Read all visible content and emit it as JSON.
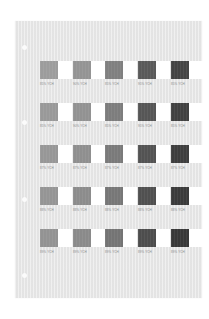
{
  "sheet": {
    "background": "#e8e8e8",
    "holes": [
      {
        "top": 24
      },
      {
        "top": 99
      },
      {
        "top": 176
      },
      {
        "top": 252
      }
    ]
  },
  "rows": [
    {
      "top": 40,
      "cells": [
        {
          "color": "#9c9c9c",
          "label": "85% YCH"
        },
        {
          "color": "#949494",
          "label": "90% YCH"
        },
        {
          "color": "#808080",
          "label": "85% YCH"
        },
        {
          "color": "#5a5a5a",
          "label": "95% YCH"
        },
        {
          "color": "#444444",
          "label": "85% YCH"
        }
      ]
    },
    {
      "top": 82,
      "cells": [
        {
          "color": "#999999",
          "label": "85% YCH"
        },
        {
          "color": "#929292",
          "label": "90% YCH"
        },
        {
          "color": "#7d7d7d",
          "label": "85% YCH"
        },
        {
          "color": "#565656",
          "label": "95% YCH"
        },
        {
          "color": "#414141",
          "label": "85% YCH"
        }
      ]
    },
    {
      "top": 124,
      "cells": [
        {
          "color": "#979797",
          "label": "87% YCH"
        },
        {
          "color": "#8f8f8f",
          "label": "87% YCH"
        },
        {
          "color": "#7a7a7a",
          "label": "87% YCH"
        },
        {
          "color": "#535353",
          "label": "87% YCH"
        },
        {
          "color": "#3e3e3e",
          "label": "87% YCH"
        }
      ]
    },
    {
      "top": 166,
      "cells": [
        {
          "color": "#959595",
          "label": "88% YCH"
        },
        {
          "color": "#8c8c8c",
          "label": "88% YCH"
        },
        {
          "color": "#777777",
          "label": "88% YCH"
        },
        {
          "color": "#505050",
          "label": "88% YCH"
        },
        {
          "color": "#3b3b3b",
          "label": "88% YCH"
        }
      ]
    },
    {
      "top": 208,
      "cells": [
        {
          "color": "#939393",
          "label": "89% YCH"
        },
        {
          "color": "#8a8a8a",
          "label": "89% YCH"
        },
        {
          "color": "#747474",
          "label": "89% YCH"
        },
        {
          "color": "#4d4d4d",
          "label": "89% YCH"
        },
        {
          "color": "#383838",
          "label": "89% YCH"
        }
      ]
    }
  ],
  "column_offsets": [
    0,
    33,
    65,
    98,
    131
  ]
}
